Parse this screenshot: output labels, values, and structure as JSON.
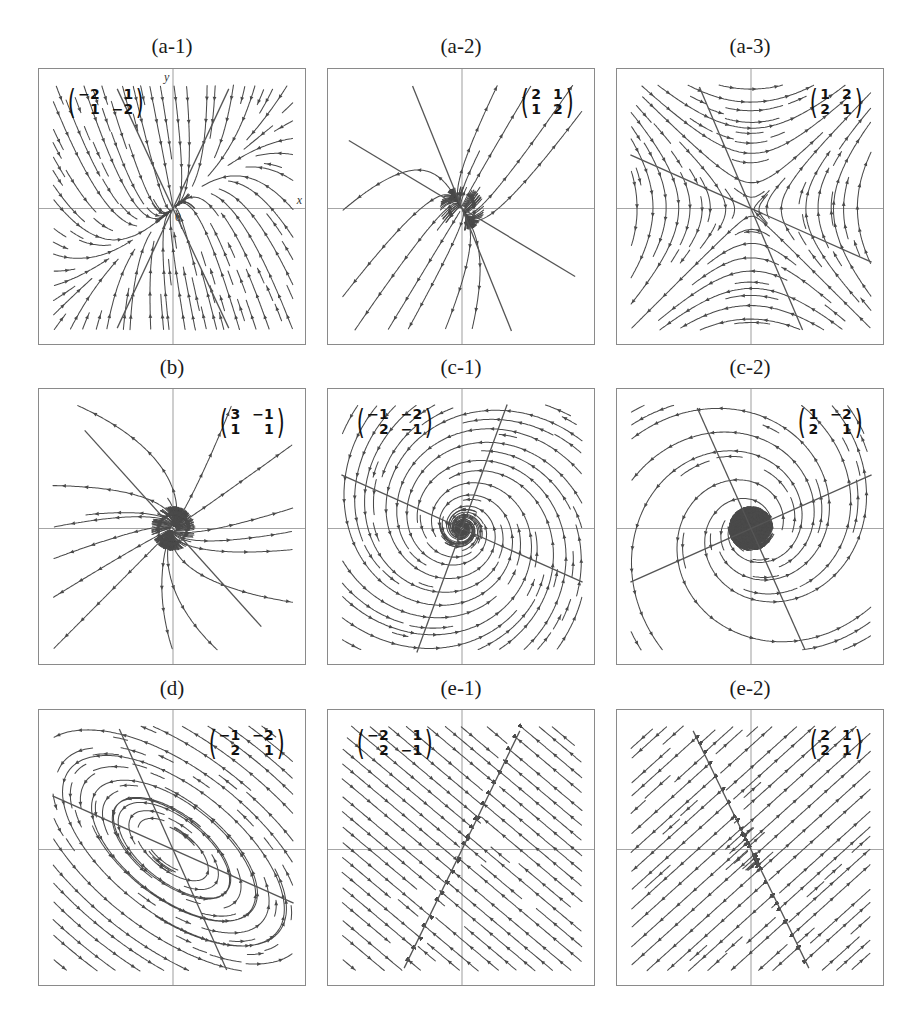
{
  "figure": {
    "panels": [
      {
        "id": "a-1",
        "title": "(a-1)",
        "matrix": [
          [
            "−2",
            "1"
          ],
          [
            "1",
            "−2"
          ]
        ],
        "matrix_pos": "top-left",
        "type": "node",
        "axis_labels": {
          "x": "x",
          "y": "y",
          "origin": "0"
        },
        "display_matrix": [
          [
            -1.0,
            0.0
          ],
          [
            0.0,
            -3.0
          ]
        ],
        "rotation_deg": 40,
        "shear": 0.55,
        "lines": [
          [
            65,
            22
          ],
          [
            115,
            25
          ]
        ],
        "arrows": "inward"
      },
      {
        "id": "a-2",
        "title": "(a-2)",
        "matrix": [
          [
            "2",
            "1"
          ],
          [
            "1",
            "2"
          ]
        ],
        "matrix_pos": "top-right",
        "type": "node",
        "display_matrix": [
          [
            1.0,
            0.0
          ],
          [
            0.0,
            3.0
          ]
        ],
        "rotation_deg": -60,
        "shear": -0.55,
        "lines": [
          [
            -31,
            0
          ],
          [
            -68,
            0
          ]
        ],
        "arrows": "outward"
      },
      {
        "id": "a-3",
        "title": "(a-3)",
        "matrix": [
          [
            "1",
            "2"
          ],
          [
            "2",
            "1"
          ]
        ],
        "matrix_pos": "top-right",
        "type": "saddle",
        "display_matrix": [
          [
            1.0,
            0.0
          ],
          [
            0.0,
            -1.0
          ]
        ],
        "rotation_deg": 45,
        "lines": [
          [
            -24,
            0
          ],
          [
            -67,
            0
          ]
        ],
        "arrows": "saddle"
      },
      {
        "id": "b",
        "title": "(b)",
        "matrix": [
          [
            "3",
            "−1"
          ],
          [
            "1",
            "1"
          ]
        ],
        "matrix_pos": "top-right",
        "type": "degenerate-node",
        "display_matrix": [
          [
            2.0,
            -1.0
          ],
          [
            0.0,
            2.0
          ]
        ],
        "rotation_deg": 45,
        "lines": [
          [
            -48,
            0
          ]
        ],
        "arrows": "outward"
      },
      {
        "id": "c-1",
        "title": "(c-1)",
        "matrix": [
          [
            "−1",
            "−2"
          ],
          [
            "2",
            "−1"
          ]
        ],
        "matrix_pos": "top-left",
        "type": "stable-spiral",
        "display_matrix": [
          [
            -0.28,
            -1.0
          ],
          [
            1.0,
            -0.28
          ]
        ],
        "lines": [
          [
            -24,
            0
          ],
          [
            70,
            0
          ]
        ],
        "arrows": "inward"
      },
      {
        "id": "c-2",
        "title": "(c-2)",
        "matrix": [
          [
            "1",
            "−2"
          ],
          [
            "2",
            "1"
          ]
        ],
        "matrix_pos": "top-right",
        "type": "unstable-spiral",
        "display_matrix": [
          [
            0.28,
            -1.0
          ],
          [
            1.0,
            0.28
          ]
        ],
        "lines": [
          [
            -66,
            0
          ],
          [
            24,
            0
          ]
        ],
        "arrows": "outward"
      },
      {
        "id": "d",
        "title": "(d)",
        "matrix": [
          [
            "−1",
            "−2"
          ],
          [
            "2",
            "1"
          ]
        ],
        "matrix_pos": "top-right",
        "type": "center",
        "display_matrix": [
          [
            0.0,
            -1.0
          ],
          [
            1.0,
            0.0
          ]
        ],
        "ellipse_ratio": 0.48,
        "ellipse_angle_deg": -38,
        "lines": [
          [
            -24,
            0
          ],
          [
            -66,
            0
          ]
        ],
        "arrows": "cyclic"
      },
      {
        "id": "e-1",
        "title": "(e-1)",
        "matrix": [
          [
            "−2",
            "1"
          ],
          [
            "2",
            "−1"
          ]
        ],
        "matrix_pos": "top-left",
        "type": "line-of-equilibria",
        "flow_angle_deg": -40,
        "lines": [
          [
            64,
            0
          ]
        ],
        "arrows": "toward-line"
      },
      {
        "id": "e-2",
        "title": "(e-2)",
        "matrix": [
          [
            "2",
            "1"
          ],
          [
            "2",
            "1"
          ]
        ],
        "matrix_pos": "top-right",
        "type": "line-of-equilibria",
        "flow_angle_deg": 42,
        "lines": [
          [
            -64,
            0
          ]
        ],
        "arrows": "away-from-line"
      }
    ],
    "colors": {
      "stroke": "#4a4a4a",
      "frame": "#8a8a8a",
      "axis": "#a6a6a6",
      "text": "#1a1a1a"
    }
  },
  "chart_data": [
    {
      "type": "phase-portrait",
      "title": "(a-1)",
      "matrix": [
        [
          -2,
          1
        ],
        [
          1,
          -2
        ]
      ],
      "classification": "stable node",
      "xlabel": "x",
      "ylabel": "y",
      "grid": false,
      "axes": true
    },
    {
      "type": "phase-portrait",
      "title": "(a-2)",
      "matrix": [
        [
          2,
          1
        ],
        [
          1,
          2
        ]
      ],
      "classification": "unstable node",
      "grid": false,
      "axes": true
    },
    {
      "type": "phase-portrait",
      "title": "(a-3)",
      "matrix": [
        [
          1,
          2
        ],
        [
          2,
          1
        ]
      ],
      "classification": "saddle",
      "grid": false,
      "axes": true
    },
    {
      "type": "phase-portrait",
      "title": "(b)",
      "matrix": [
        [
          3,
          -1
        ],
        [
          1,
          1
        ]
      ],
      "classification": "degenerate (improper) unstable node",
      "grid": false,
      "axes": true
    },
    {
      "type": "phase-portrait",
      "title": "(c-1)",
      "matrix": [
        [
          -1,
          -2
        ],
        [
          2,
          -1
        ]
      ],
      "classification": "stable spiral",
      "grid": false,
      "axes": true
    },
    {
      "type": "phase-portrait",
      "title": "(c-2)",
      "matrix": [
        [
          1,
          -2
        ],
        [
          2,
          1
        ]
      ],
      "classification": "unstable spiral",
      "grid": false,
      "axes": true
    },
    {
      "type": "phase-portrait",
      "title": "(d)",
      "matrix": [
        [
          -1,
          -2
        ],
        [
          2,
          1
        ]
      ],
      "classification": "center",
      "grid": false,
      "axes": true
    },
    {
      "type": "phase-portrait",
      "title": "(e-1)",
      "matrix": [
        [
          -2,
          1
        ],
        [
          2,
          -1
        ]
      ],
      "classification": "line of stable equilibria",
      "grid": false,
      "axes": true
    },
    {
      "type": "phase-portrait",
      "title": "(e-2)",
      "matrix": [
        [
          2,
          1
        ],
        [
          2,
          1
        ]
      ],
      "classification": "line of unstable equilibria",
      "grid": false,
      "axes": true
    }
  ]
}
